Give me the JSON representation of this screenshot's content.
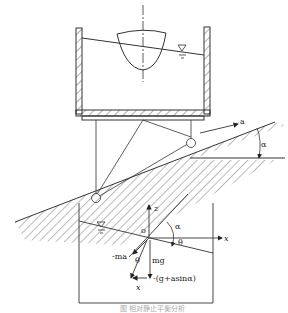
{
  "figure": {
    "top": {
      "accel_label": "a",
      "angle_label": "α"
    },
    "bottom": {
      "z_axis": "z",
      "x_axis": "x",
      "origin": "o",
      "alpha": "α",
      "theta": "θ",
      "theta2": "θ",
      "neg_ma": "-ma",
      "mg": "mg",
      "resultant": "-(g+asinα)",
      "x_vec": "x"
    },
    "caption": "图 相对静止平衡分析"
  }
}
